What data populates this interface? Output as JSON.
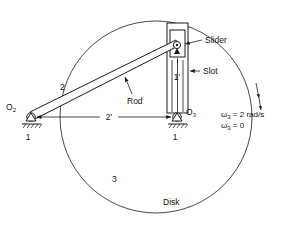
{
  "figure": {
    "background": "#ffffff",
    "ink": "#1a1a1a"
  },
  "labels": {
    "pivot_o2": "O",
    "pivot_o2_sub": "2",
    "pivot_o3": "O",
    "pivot_o3_sub": "3",
    "ground_left": "1",
    "ground_right": "1",
    "link_rod_number": "2",
    "link_disk_number": "3",
    "dimension_horizontal": "2'",
    "dimension_vertical": "1'",
    "slider": "Slider",
    "slot": "Slot",
    "rod": "Rod",
    "disk": "Disk"
  },
  "annotations": {
    "omega_symbol": "ω",
    "omega_sub": "3",
    "omega_value": "= 2 rad/s",
    "omega_dot_symbol": "ω̇",
    "omega_dot_sub": "3",
    "omega_dot_value": "= 0",
    "rotation_arrow": "rotation-direction-arrow"
  },
  "geometry": {
    "disk_center_x": 156,
    "disk_center_y": 117,
    "disk_radius": 96,
    "o2_x": 31,
    "o2_y": 117,
    "o3_x": 177,
    "o3_y": 117,
    "slider_pin_x": 177,
    "slider_pin_y": 45
  }
}
